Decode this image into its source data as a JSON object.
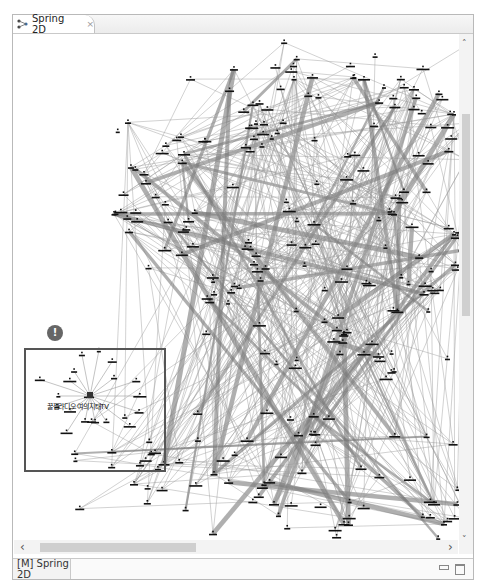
{
  "window": {
    "tab_label": "Spring 2D",
    "tab_icon": "graph-icon",
    "close_icon": "×",
    "status_tab_label": "[M] Spring 2D",
    "minimize_icon": "minimize-icon",
    "maximize_icon": "maximize-icon"
  },
  "scrollbars": {
    "up_arrow": "˄",
    "down_arrow": "˅",
    "left_arrow": "‹",
    "right_arrow": "›"
  },
  "graph": {
    "selection_badge": "!",
    "hub_label": "꿀잼라디오 여의지태TV",
    "colors": {
      "edge": "#9a9a9a",
      "edge_heavy": "#7a7a7a",
      "node": "#111111",
      "selection": "#555555",
      "badge": "#666666"
    }
  }
}
